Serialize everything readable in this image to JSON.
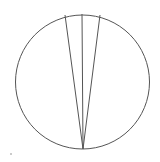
{
  "diagram": {
    "type": "geometry",
    "stroke_color": "#555555",
    "background": "#ffffff",
    "circle": {
      "cx": 82.5,
      "cy": 82,
      "r": 67
    },
    "vertex": {
      "x": 83,
      "y": 149
    },
    "chords": [
      {
        "name": "left-chord",
        "x2": 65,
        "y2": 15
      },
      {
        "name": "middle-chord",
        "x2": 82,
        "y2": 14
      },
      {
        "name": "right-chord",
        "x2": 100,
        "y2": 15
      }
    ],
    "top_arc_segment": {
      "x1": 65,
      "y1": 15,
      "x2": 100,
      "y2": 15
    },
    "artifact_dot": {
      "x": 11,
      "y": 154,
      "r": 0.8
    }
  }
}
